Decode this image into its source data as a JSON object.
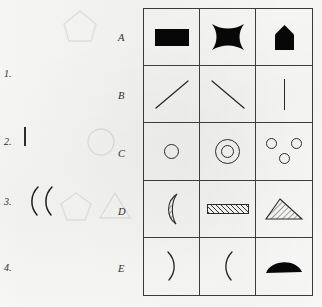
{
  "page": {
    "kind": "psychometric-shape-matching-worksheet",
    "background_color": "#fbfbf9",
    "ink_color": "#1d1d1d"
  },
  "options": {
    "items": [
      {
        "number": "1.",
        "shape": "filled-circle",
        "description": "solid black disc"
      },
      {
        "number": "2.",
        "shape": "hatched-rectangle",
        "description": "rectangle with diagonal hatching"
      },
      {
        "number": "3.",
        "shape": "double-arc",
        "description": "two left-facing arcs",
        "glyph": "(("
      },
      {
        "number": "4.",
        "shape": "horizontal-line",
        "description": "short horizontal line"
      }
    ]
  },
  "grid": {
    "row_labels": [
      "A",
      "B",
      "C",
      "D",
      "E"
    ],
    "rows": [
      {
        "label": "A",
        "cells": [
          {
            "shape": "filled-rectangle",
            "fill": "solid-black"
          },
          {
            "shape": "concave-square",
            "fill": "solid-black"
          },
          {
            "shape": "pentagon-house",
            "fill": "solid-black"
          }
        ]
      },
      {
        "label": "B",
        "cells": [
          {
            "shape": "diagonal-line-up",
            "fill": "outline"
          },
          {
            "shape": "diagonal-line-down",
            "fill": "outline"
          },
          {
            "shape": "vertical-line",
            "fill": "outline"
          }
        ]
      },
      {
        "label": "C",
        "cells": [
          {
            "shape": "small-circle",
            "fill": "outline"
          },
          {
            "shape": "concentric-circles",
            "fill": "outline"
          },
          {
            "shape": "three-small-circles",
            "fill": "outline"
          }
        ]
      },
      {
        "label": "D",
        "cells": [
          {
            "shape": "crescent",
            "fill": "hatched"
          },
          {
            "shape": "thin-rectangle",
            "fill": "hatched"
          },
          {
            "shape": "triangle",
            "fill": "hatched"
          }
        ]
      },
      {
        "label": "E",
        "cells": [
          {
            "shape": "arc-right",
            "fill": "outline",
            "glyph": ")"
          },
          {
            "shape": "arc-left",
            "fill": "outline",
            "glyph": "("
          },
          {
            "shape": "half-dome",
            "fill": "solid-black"
          }
        ]
      }
    ]
  }
}
